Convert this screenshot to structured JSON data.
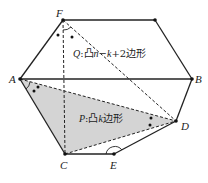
{
  "diagram": {
    "type": "convex polygon decomposition",
    "vertices": {
      "F": {
        "label": "F",
        "x": 63,
        "y": 20
      },
      "T": {
        "label": "",
        "x": 155,
        "y": 20
      },
      "A": {
        "label": "A",
        "x": 20,
        "y": 79
      },
      "B": {
        "label": "B",
        "x": 192,
        "y": 79
      },
      "D": {
        "label": "D",
        "x": 176,
        "y": 121
      },
      "E": {
        "label": "E",
        "x": 114,
        "y": 154
      },
      "C": {
        "label": "C",
        "x": 65,
        "y": 154
      }
    },
    "solid_edges": [
      [
        "F",
        "T"
      ],
      [
        "T",
        "B"
      ],
      [
        "B",
        "D"
      ],
      [
        "D",
        "E"
      ],
      [
        "E",
        "C"
      ],
      [
        "C",
        "A"
      ],
      [
        "A",
        "F"
      ],
      [
        "A",
        "B"
      ]
    ],
    "dashed_edges": [
      [
        "F",
        "C"
      ],
      [
        "F",
        "D"
      ],
      [
        "A",
        "D"
      ],
      [
        "C",
        "D"
      ]
    ],
    "shaded_region": [
      "A",
      "C",
      "D"
    ],
    "shade_color": "#d4d4d4",
    "line_color": "#222222",
    "region_labels": {
      "Q": {
        "prefix": "Q",
        "sep": ":",
        "text1": "凸",
        "var": "n",
        "mid": "−",
        "var2": "k",
        "tail": "+2边形"
      },
      "P": {
        "prefix": "P",
        "sep": ":",
        "text1": "凸",
        "var": "k",
        "tail": "边形"
      }
    }
  }
}
